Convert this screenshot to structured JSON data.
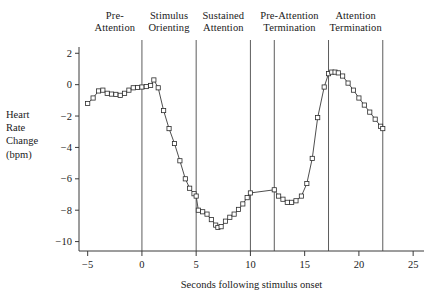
{
  "chart_data": {
    "type": "line",
    "title": "",
    "xlabel": "Seconds following stimulus onset",
    "ylabel": "Heart Rate Change (bpm)",
    "ylabel_lines": [
      "Heart",
      "Rate",
      "Change",
      "(bpm)"
    ],
    "xlim": [
      -5.8,
      26.0
    ],
    "ylim": [
      -10.6,
      2.4
    ],
    "xticks": [
      -5,
      0,
      5,
      10,
      15,
      20,
      25
    ],
    "xticklabels": [
      "−5",
      "0",
      "5",
      "10",
      "15",
      "20",
      "25"
    ],
    "yticks": [
      2,
      0,
      -2,
      -4,
      -6,
      -8,
      -10
    ],
    "yticklabels": [
      "2",
      "0",
      "−2",
      "−4",
      "−6",
      "−8",
      "−10"
    ],
    "grid": false,
    "legend": null,
    "marker": "open-square",
    "line_color": "#3a3a3a",
    "marker_edge_color": "#2b2b2b",
    "marker_face_color": "#ffffff",
    "series": [
      {
        "name": "Heart rate change",
        "x": [
          -5.0,
          -4.5,
          -4.0,
          -3.6,
          -3.2,
          -2.8,
          -2.4,
          -2.0,
          -1.6,
          -1.2,
          -0.8,
          -0.4,
          0.0,
          0.4,
          0.8,
          1.1,
          1.5,
          2.0,
          2.5,
          3.0,
          3.5,
          4.0,
          4.4,
          4.8,
          5.0,
          5.2,
          5.6,
          6.0,
          6.4,
          6.8,
          7.0,
          7.3,
          7.7,
          8.1,
          8.5,
          8.9,
          9.3,
          9.7,
          10.0,
          12.2,
          12.6,
          13.0,
          13.4,
          13.8,
          14.2,
          14.7,
          15.2,
          15.7,
          16.2,
          16.8,
          17.2,
          17.5,
          17.8,
          18.1,
          18.5,
          19.0,
          19.5,
          20.0,
          20.5,
          21.0,
          21.5,
          22.0,
          22.2
        ],
        "y": [
          -1.2,
          -0.85,
          -0.4,
          -0.35,
          -0.55,
          -0.6,
          -0.62,
          -0.68,
          -0.55,
          -0.35,
          -0.2,
          -0.18,
          -0.15,
          -0.12,
          -0.05,
          0.3,
          -0.2,
          -1.65,
          -2.8,
          -3.75,
          -4.85,
          -6.0,
          -6.6,
          -6.95,
          -7.1,
          -8.0,
          -8.1,
          -8.25,
          -8.6,
          -8.95,
          -9.1,
          -9.05,
          -8.7,
          -8.45,
          -8.25,
          -7.95,
          -7.6,
          -7.2,
          -6.9,
          -6.7,
          -7.1,
          -7.3,
          -7.5,
          -7.5,
          -7.4,
          -7.1,
          -6.3,
          -4.7,
          -2.1,
          -0.15,
          0.7,
          0.8,
          0.8,
          0.75,
          0.55,
          0.1,
          -0.35,
          -0.85,
          -1.3,
          -1.75,
          -2.2,
          -2.65,
          -2.8
        ]
      }
    ],
    "phase_dividers": [
      0,
      5,
      10,
      12.2,
      17.2,
      22.2
    ],
    "phase_labels": [
      {
        "lines": [
          "Pre-",
          "Attention"
        ],
        "center_x": -2.5
      },
      {
        "lines": [
          "Stimulus",
          "Orienting"
        ],
        "center_x": 2.5
      },
      {
        "lines": [
          "Sustained",
          "Attention"
        ],
        "center_x": 7.5
      },
      {
        "lines": [
          "Pre-Attention",
          "Termination"
        ],
        "center_x": 13.6
      },
      {
        "lines": [
          "Attention",
          "Termination"
        ],
        "center_x": 19.7
      }
    ]
  }
}
